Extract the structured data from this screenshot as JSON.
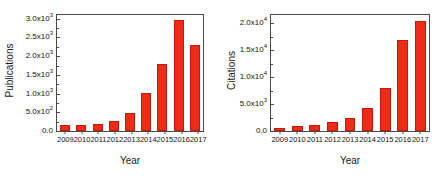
{
  "figure": {
    "background": "#ffffff",
    "bar_color": "#ee2b16",
    "axis_color": "#4a4a4a"
  },
  "chart_data": [
    {
      "type": "bar",
      "id": "publications",
      "title": "",
      "xlabel": "Year",
      "ylabel": "Publications",
      "categories": [
        "2009",
        "2010",
        "2011",
        "2012",
        "2013",
        "2014",
        "2015",
        "2016",
        "2017"
      ],
      "values": [
        150,
        160,
        190,
        280,
        480,
        1020,
        1790,
        2970,
        2300
      ],
      "ylim": [
        0,
        3100
      ],
      "yticks": [
        0,
        500,
        1000,
        1500,
        2000,
        2500,
        3000
      ],
      "ytick_labels": [
        {
          "mantissa": "0.0",
          "exp": ""
        },
        {
          "mantissa": "5.0x10",
          "exp": "2"
        },
        {
          "mantissa": "1.0x10",
          "exp": "3"
        },
        {
          "mantissa": "1.5x10",
          "exp": "3"
        },
        {
          "mantissa": "2.0x10",
          "exp": "3"
        },
        {
          "mantissa": "2.5x10",
          "exp": "3"
        },
        {
          "mantissa": "3.0x10",
          "exp": "3"
        }
      ],
      "grid": false,
      "legend": "none"
    },
    {
      "type": "bar",
      "id": "citations",
      "title": "",
      "xlabel": "Year",
      "ylabel": "Citations",
      "categories": [
        "2009",
        "2010",
        "2011",
        "2012",
        "2013",
        "2014",
        "2015",
        "2016",
        "2017"
      ],
      "values": [
        550,
        850,
        1150,
        1650,
        2450,
        4300,
        7900,
        16800,
        20300
      ],
      "ylim": [
        0,
        21500
      ],
      "yticks": [
        0,
        5000,
        10000,
        15000,
        20000
      ],
      "ytick_labels": [
        {
          "mantissa": "0.0",
          "exp": ""
        },
        {
          "mantissa": "5.0x10",
          "exp": "3"
        },
        {
          "mantissa": "1.0x10",
          "exp": "4"
        },
        {
          "mantissa": "1.5x10",
          "exp": "4"
        },
        {
          "mantissa": "2.0x10",
          "exp": "4"
        }
      ],
      "grid": false,
      "legend": "none"
    }
  ]
}
